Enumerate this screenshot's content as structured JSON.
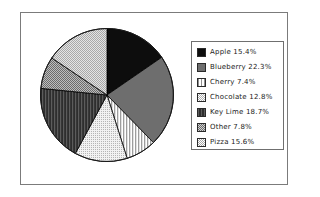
{
  "chart_data": {
    "type": "pie",
    "title": "",
    "categories": [
      "Apple",
      "Blueberry",
      "Cherry",
      "Chocolate",
      "Key Lime",
      "Other",
      "Pizza"
    ],
    "values": [
      15.4,
      22.3,
      7.4,
      12.8,
      18.7,
      7.8,
      15.6
    ],
    "unit": "%",
    "start_angle_deg": 0,
    "direction": "clockwise",
    "legend_position": "right",
    "grid": false,
    "slices": [
      {
        "label": "Apple",
        "value": 15.4,
        "legend_text": "Apple  15.4%",
        "pattern": "solid-black",
        "fill": "#0d0d0d",
        "stroke": "#000000"
      },
      {
        "label": "Blueberry",
        "value": 22.3,
        "legend_text": "Blueberry  22.3%",
        "pattern": "solid-dark-gray",
        "fill": "#6e6e6e",
        "stroke": "#000000"
      },
      {
        "label": "Cherry",
        "value": 7.4,
        "legend_text": "Cherry  7.4%",
        "pattern": "vertical-lines",
        "fill": "#c8c8c8",
        "stroke": "#000000"
      },
      {
        "label": "Chocolate",
        "value": 12.8,
        "legend_text": "Chocolate  12.8%",
        "pattern": "fine-dots-light",
        "fill": "#e6e6e6",
        "stroke": "#000000"
      },
      {
        "label": "Key Lime",
        "value": 18.7,
        "legend_text": "Key Lime  18.7%",
        "pattern": "dark-vertical",
        "fill": "#3a3a3a",
        "stroke": "#000000"
      },
      {
        "label": "Other",
        "value": 7.8,
        "legend_text": "Other  7.8%",
        "pattern": "checker-gray",
        "fill": "#9a9a9a",
        "stroke": "#000000"
      },
      {
        "label": "Pizza",
        "value": 15.6,
        "legend_text": "Pizza  15.6%",
        "pattern": "light-checker",
        "fill": "#d2d2d2",
        "stroke": "#000000"
      }
    ]
  },
  "frame": {
    "border_color": "#7b7b7b",
    "background": "#ffffff"
  },
  "legend": {
    "border_color": "#6f6f6f",
    "items": [
      {
        "label": "Apple  15.4%"
      },
      {
        "label": "Blueberry  22.3%"
      },
      {
        "label": "Cherry  7.4%"
      },
      {
        "label": "Chocolate  12.8%"
      },
      {
        "label": "Key Lime  18.7%"
      },
      {
        "label": "Other  7.8%"
      },
      {
        "label": "Pizza  15.6%"
      }
    ]
  }
}
